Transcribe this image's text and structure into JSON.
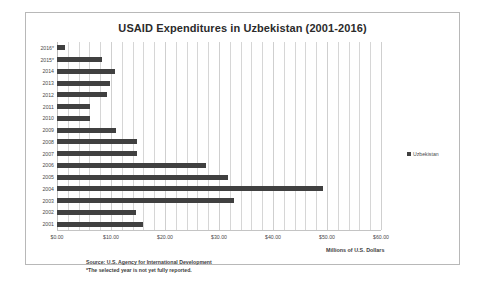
{
  "chart_data": {
    "type": "bar",
    "orientation": "horizontal",
    "title": "USAID Expenditures in Uzbekistan (2001-2016)",
    "xlabel": "Millions of U.S. Dollars",
    "ylabel": "",
    "xlim": [
      0,
      60
    ],
    "xticks": [
      0,
      10,
      20,
      30,
      40,
      50,
      60
    ],
    "xtick_labels": [
      "$0.00",
      "$10.00",
      "$20.00",
      "$30.00",
      "$40.00",
      "$50.00",
      "$60.00"
    ],
    "grid": true,
    "grid_interval": 2,
    "legend": [
      "Uzbekistan"
    ],
    "legend_position": "right",
    "bar_color": "#404040",
    "categories": [
      "2016*",
      "2015*",
      "2014",
      "2013",
      "2012",
      "2011",
      "2010",
      "2009",
      "2008",
      "2007",
      "2006",
      "2005",
      "2004",
      "2003",
      "2002",
      "2001"
    ],
    "values": [
      1.5,
      8.3,
      10.8,
      9.8,
      9.3,
      6.2,
      6.2,
      11.0,
      14.9,
      14.9,
      27.5,
      31.7,
      49.2,
      32.7,
      14.7,
      16.0
    ],
    "series": [
      {
        "name": "Uzbekistan",
        "values": [
          1.5,
          8.3,
          10.8,
          9.8,
          9.3,
          6.2,
          6.2,
          11.0,
          14.9,
          14.9,
          27.5,
          31.7,
          49.2,
          32.7,
          14.7,
          16.0
        ]
      }
    ],
    "annotations": [
      "Source: U.S. Agency for International Development",
      "*The selected year is not yet fully reported."
    ]
  },
  "footnotes": {
    "source": "Source: U.S. Agency for International Development",
    "note": "*The selected year is not yet fully reported."
  },
  "legend": {
    "label": "Uzbekistan"
  }
}
